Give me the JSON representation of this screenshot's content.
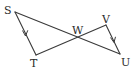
{
  "diagram": {
    "points": [
      {
        "id": "S",
        "label": "S"
      },
      {
        "id": "T",
        "label": "T"
      },
      {
        "id": "W",
        "label": "W"
      },
      {
        "id": "V",
        "label": "V"
      },
      {
        "id": "U",
        "label": "U"
      }
    ],
    "segments": [
      {
        "from": "S",
        "to": "U"
      },
      {
        "from": "T",
        "to": "V"
      },
      {
        "from": "S",
        "to": "T",
        "marker": "parallel-arrow"
      },
      {
        "from": "V",
        "to": "U",
        "marker": "parallel-arrow"
      }
    ],
    "relations": [
      "ST ∥ VU"
    ]
  }
}
